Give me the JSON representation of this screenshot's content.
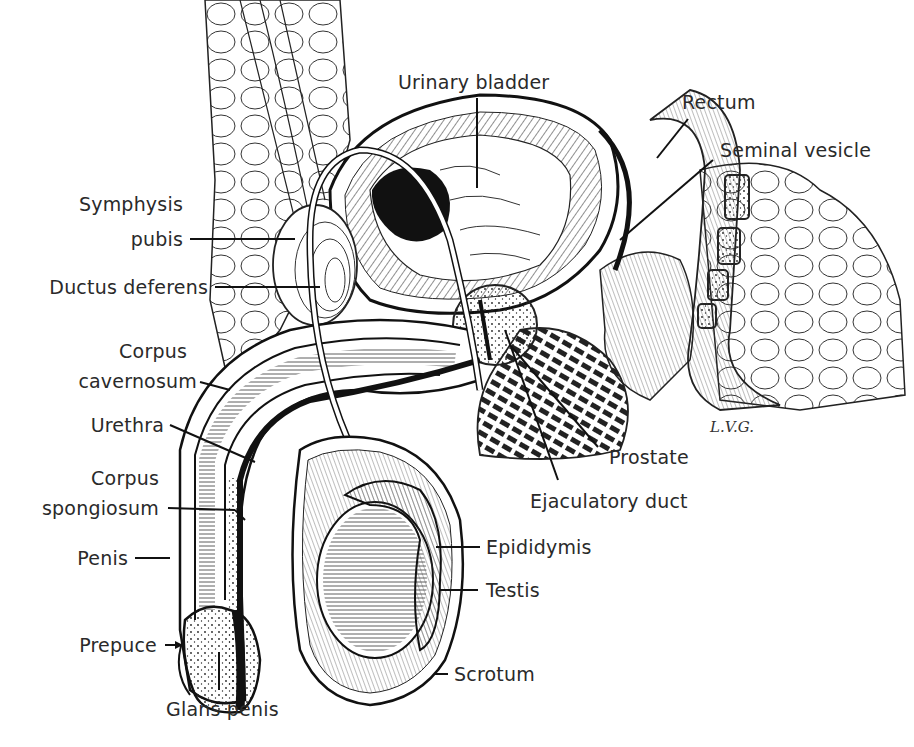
{
  "figure": {
    "type": "anatomical-illustration",
    "signature": "L.V.G.",
    "labels": {
      "urinary_bladder": "Urinary bladder",
      "rectum": "Rectum",
      "seminal_vesicle": "Seminal vesicle",
      "symphysis_pubis_1": "Symphysis",
      "symphysis_pubis_2": "pubis",
      "ductus_deferens": "Ductus deferens",
      "corpus_cavernosum_1": "Corpus",
      "corpus_cavernosum_2": "cavernosum",
      "urethra": "Urethra",
      "corpus_spongiosum_1": "Corpus",
      "corpus_spongiosum_2": "spongiosum",
      "penis": "Penis",
      "prepuce": "Prepuce",
      "glans_penis": "Glans penis",
      "prostate": "Prostate",
      "ejaculatory_duct": "Ejaculatory duct",
      "epididymis": "Epididymis",
      "testis": "Testis",
      "scrotum": "Scrotum"
    },
    "colors": {
      "ink": "#1a1a1a",
      "text": "#2a2a2a",
      "background": "#ffffff"
    }
  }
}
